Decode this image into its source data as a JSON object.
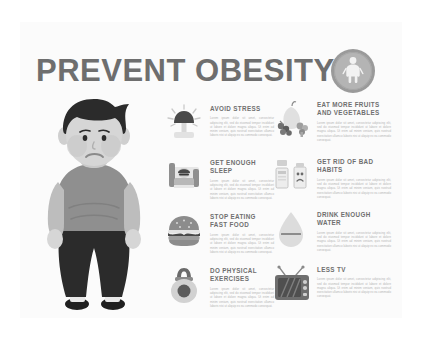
{
  "header": {
    "title": "PREVENT OBESITY",
    "logo_icon": "human-figure-badge-icon"
  },
  "character": {
    "name": "overweight-man-illustration",
    "description": "Cartoon illustration of an overweight man with dark hair, grey t-shirt, dark trousers and dark shoes, standing with a sad expression",
    "colors": {
      "hair": "#2b2b2b",
      "skin": "#d6d6d6",
      "shirt": "#8f8f8f",
      "sleeve": "#bdbdbd",
      "pants": "#2b2b2b",
      "shoes": "#1f1f1f"
    }
  },
  "palette": {
    "background": "#ffffff",
    "panel": "#fbfbfb",
    "title_color": "#6e6e6e",
    "heading_color": "#6f6f6f",
    "body_color": "#b6b6b6",
    "badge_outer": "#9a9a9a",
    "badge_inner": "#b4b4b4"
  },
  "body_placeholder": "Lorem ipsum dolor sit amet, consectetur adipiscing elit, sed do eiusmod tempor incididunt ut labore et dolore magna aliqua. Ut enim ad minim veniam, quis nostrud exercitation ullamco laboris nisi ut aliquip ex ea commodo consequat.",
  "tips": [
    {
      "id": "avoid-stress",
      "title": "AVOID STRESS",
      "icon": "stressed-head-icon",
      "column": "left",
      "row": 1
    },
    {
      "id": "eat-more-fruits-and-vegetables",
      "title": "EAT MORE FRUITS AND VEGETABLES",
      "icon": "fruits-vegetables-icon",
      "column": "right",
      "row": 1
    },
    {
      "id": "get-enough-sleep",
      "title": "GET ENOUGH SLEEP",
      "icon": "sleeping-person-icon",
      "column": "left",
      "row": 2
    },
    {
      "id": "get-rid-of-bad-habits",
      "title": "GET RID OF BAD HABITS",
      "icon": "cigarettes-alcohol-icon",
      "column": "right",
      "row": 2
    },
    {
      "id": "stop-eating-fast-food",
      "title": "STOP EATING FAST FOOD",
      "icon": "hamburger-icon",
      "column": "left",
      "row": 3
    },
    {
      "id": "drink-enough-water",
      "title": "DRINK ENOUGH WATER",
      "icon": "water-drop-icon",
      "column": "right",
      "row": 3
    },
    {
      "id": "do-physical-exercises",
      "title": "DO PHYSICAL EXERCISES",
      "icon": "kettlebell-icon",
      "column": "left",
      "row": 4
    },
    {
      "id": "less-tv",
      "title": "LESS TV",
      "icon": "retro-tv-icon",
      "column": "right",
      "row": 4
    }
  ]
}
